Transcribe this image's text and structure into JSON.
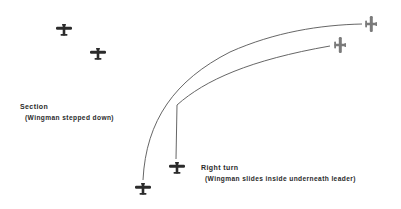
{
  "diagram": {
    "colors": {
      "plane_dark": "#2b2b2b",
      "plane_gray": "#7a7a7a",
      "path_line": "#555555",
      "text": "#2a2a2a"
    },
    "section": {
      "title": "Section",
      "note": "(Wingman stepped down)"
    },
    "right_turn": {
      "title": "Right turn",
      "note": "(Wingman slides inside underneath leader)"
    },
    "planes": [
      {
        "role": "leader",
        "phase": "section",
        "x": 64,
        "y": 29,
        "heading": "up"
      },
      {
        "role": "wingman",
        "phase": "section",
        "x": 98,
        "y": 53,
        "heading": "up"
      },
      {
        "role": "leader",
        "phase": "turn-start",
        "x": 143,
        "y": 188,
        "heading": "up"
      },
      {
        "role": "wingman",
        "phase": "turn-start",
        "x": 177,
        "y": 167,
        "heading": "up"
      },
      {
        "role": "leader",
        "phase": "turn-end",
        "x": 372,
        "y": 24,
        "heading": "right"
      },
      {
        "role": "wingman",
        "phase": "turn-end",
        "x": 341,
        "y": 45,
        "heading": "right"
      }
    ]
  }
}
